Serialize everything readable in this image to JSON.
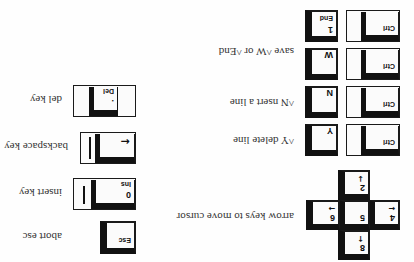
{
  "orientation": "rotated 180deg",
  "arrow_cluster": {
    "keys": [
      {
        "id": "up",
        "number": "8",
        "arrow": "↑"
      },
      {
        "id": "left",
        "number": "4",
        "arrow": "←"
      },
      {
        "id": "center",
        "number": "5",
        "arrow": ""
      },
      {
        "id": "right",
        "number": "6",
        "arrow": "→"
      },
      {
        "id": "down",
        "number": "2",
        "arrow": "↓"
      }
    ],
    "description": "arrow keys to move cursor"
  },
  "ctrl_combos": [
    {
      "modifier": "Ctrl",
      "key": "Y",
      "key_sub": "",
      "description": "^Y delete line"
    },
    {
      "modifier": "Ctrl",
      "key": "N",
      "key_sub": "",
      "description": "^N  nsert a line"
    },
    {
      "modifier": "Ctrl",
      "key": "W",
      "key_sub": "",
      "description": "save ^W or ^End"
    },
    {
      "modifier": "Ctrl",
      "key": "1",
      "key_sub": "End",
      "description": ""
    }
  ],
  "single_keys": [
    {
      "id": "esc",
      "cap_top": "Esc",
      "cap_bottom": "",
      "description": "abort esc"
    },
    {
      "id": "insert",
      "cap_top": "Ins",
      "cap_bottom": "0",
      "description": "insert key"
    },
    {
      "id": "backspace",
      "cap_top": "",
      "cap_bottom": "←",
      "description": "backspace key"
    },
    {
      "id": "delete",
      "cap_top": "Del",
      "cap_bottom": ".",
      "description": "del key"
    }
  ]
}
